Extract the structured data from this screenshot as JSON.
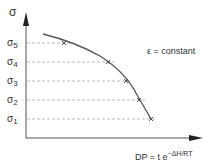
{
  "diagram": {
    "y_axis_label": "σ",
    "x_axis_label_base": "DP = t e",
    "x_axis_label_exponent": "−ΔH/RT",
    "annotation": "ε = constant",
    "levels": [
      {
        "symbol": "σ",
        "sub": "5",
        "y": 43,
        "marker_x": 64
      },
      {
        "symbol": "σ",
        "sub": "4",
        "y": 62,
        "marker_x": 108
      },
      {
        "symbol": "σ",
        "sub": "3",
        "y": 81,
        "marker_x": 126
      },
      {
        "symbol": "σ",
        "sub": "2",
        "y": 100,
        "marker_x": 139
      },
      {
        "symbol": "σ",
        "sub": "1",
        "y": 119,
        "marker_x": 151
      }
    ],
    "colors": {
      "axis": "#555555",
      "curve": "#555555",
      "dashed": "#aaaaaa",
      "text": "#333333"
    }
  }
}
